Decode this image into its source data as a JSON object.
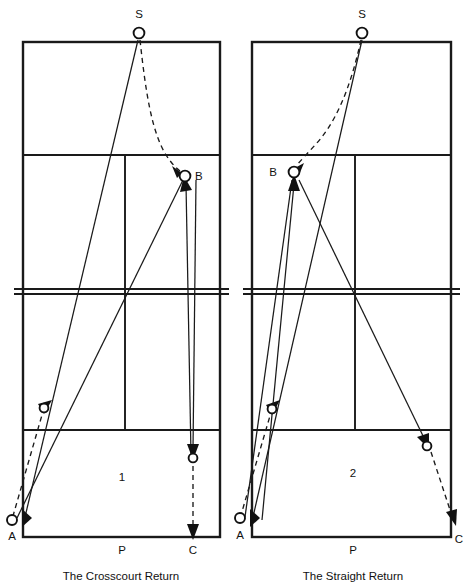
{
  "figure": {
    "type": "tennis-tactics-diagram",
    "panels": [
      {
        "id": "panel-1",
        "number": "1",
        "caption": "The Crosscourt Return",
        "player_label": "P",
        "points": [
          {
            "key": "S",
            "label": "S",
            "role": "server-position",
            "x": 139,
            "y": 33
          },
          {
            "key": "B",
            "label": "B",
            "role": "return-contact-point",
            "x": 185,
            "y": 176
          },
          {
            "key": "A",
            "label": "A",
            "role": "crosscourt-return-target",
            "x": 12,
            "y": 520
          },
          {
            "key": "C",
            "label": "C",
            "role": "down-the-line-target",
            "x": 193,
            "y": 537
          }
        ],
        "bounce_markers": [
          {
            "role": "bounce-left",
            "x": 44,
            "y": 408
          },
          {
            "role": "bounce-right",
            "x": 193,
            "y": 458
          }
        ]
      },
      {
        "id": "panel-2",
        "number": "2",
        "caption": "The Straight Return",
        "player_label": "P",
        "points": [
          {
            "key": "S",
            "label": "S",
            "role": "server-position",
            "x": 362,
            "y": 33
          },
          {
            "key": "B",
            "label": "B",
            "role": "return-contact-point",
            "x": 294,
            "y": 172
          },
          {
            "key": "A",
            "label": "A",
            "role": "crosscourt-return-target",
            "x": 240,
            "y": 518
          },
          {
            "key": "C",
            "label": "C",
            "role": "down-the-line-target",
            "x": 458,
            "y": 537
          }
        ],
        "bounce_markers": [
          {
            "role": "bounce-left",
            "x": 272,
            "y": 409
          },
          {
            "role": "bounce-right",
            "x": 427,
            "y": 446
          }
        ]
      }
    ],
    "colors": {
      "line": "#1a1a1a",
      "path": "#1a1a1a",
      "background": "#ffffff",
      "marker_fill": "#ffffff"
    },
    "court_geometry": {
      "note": "tennis court seen from above; doubles box, service lines, net, center service line",
      "left_court": {
        "left": 23,
        "right": 220,
        "top": 42,
        "bottom": 537,
        "service_line_top": 155,
        "service_line_bottom": 430,
        "net_y": 291,
        "center_service_x": 125
      },
      "right_court": {
        "left": 252,
        "right": 451,
        "top": 42,
        "bottom": 537,
        "service_line_top": 155,
        "service_line_bottom": 430,
        "net_y": 291,
        "center_service_x": 355
      }
    }
  }
}
